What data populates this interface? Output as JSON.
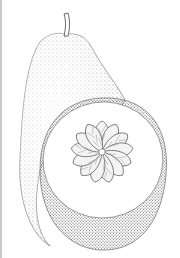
{
  "image": {
    "subject": "pomelo fruit illustration",
    "style": "stippled pen-and-ink botanical drawing",
    "elements": [
      "whole fruit with stem",
      "cut half showing segments"
    ],
    "segment_count": 13,
    "colors": {
      "background": "#ffffff",
      "ink": "#3a3a3a",
      "light_ink": "#8a8a8a",
      "edge": "#c8c8c8"
    }
  }
}
